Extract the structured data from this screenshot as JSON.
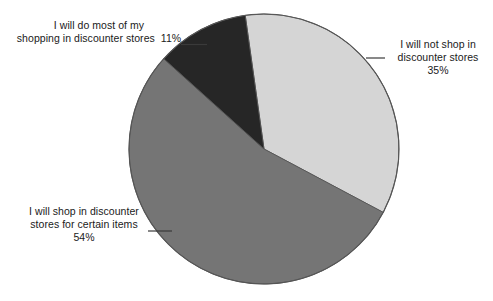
{
  "chart_data": {
    "type": "pie",
    "title": "",
    "subtitle": "",
    "xlabel": "",
    "ylabel": "",
    "legend_position": "none",
    "grid": false,
    "units": "percent",
    "total": 100,
    "categories": [
      "I will not shop in discounter stores",
      "I will shop in discounter stores for certain items",
      "I will do most of my shopping in discounter stores"
    ],
    "values": [
      35,
      54,
      11
    ],
    "slices": [
      {
        "label": "I will not shop in discounter stores",
        "label_lines": [
          "I will not shop in",
          "discounter stores"
        ],
        "value": 35,
        "value_text": "35%",
        "color": "#d5d5d5",
        "start_angle_deg": 352,
        "end_angle_deg": 478,
        "label_position": "right"
      },
      {
        "label": "I will shop in discounter stores for certain items",
        "label_lines": [
          "I will shop in discounter",
          "stores for certain items"
        ],
        "value": 54,
        "value_text": "54%",
        "color": "#757575",
        "start_angle_deg": 118,
        "end_angle_deg": 312,
        "label_position": "left-bottom"
      },
      {
        "label": "I will do most of my shopping in discounter stores",
        "label_lines": [
          "I will do most of my",
          "shopping in discounter stores"
        ],
        "value": 11,
        "value_text": "11%",
        "color": "#262626",
        "start_angle_deg": 312,
        "end_angle_deg": 352,
        "label_position": "left-top"
      }
    ],
    "geometry": {
      "center_x": 264,
      "center_y": 149,
      "radius": 135,
      "stroke_color": "#555555"
    }
  },
  "labels": {
    "top_left": {
      "line1": "I will do most of my",
      "line2": "shopping in discounter stores",
      "percent": "11%"
    },
    "right": {
      "line1": "I will not shop in",
      "line2": "discounter stores",
      "percent": "35%"
    },
    "bottom_left": {
      "line1": "I will shop in discounter",
      "line2": "stores for certain items",
      "percent": "54%"
    }
  }
}
